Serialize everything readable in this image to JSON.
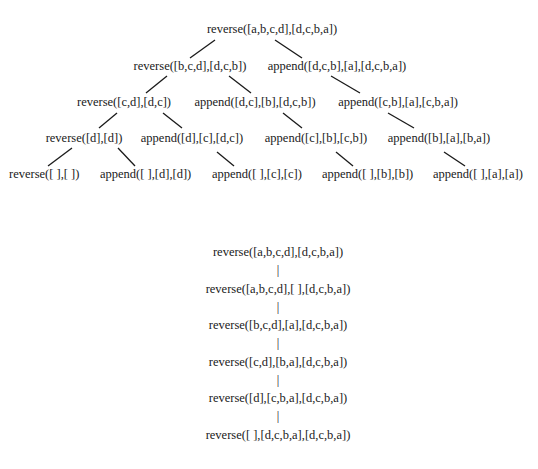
{
  "tree": {
    "nodes": [
      {
        "id": "n0",
        "label": "reverse([a,b,c,d],[d,c,b,a])"
      },
      {
        "id": "n1",
        "label": "reverse([b,c,d],[d,c,b])"
      },
      {
        "id": "n2",
        "label": "append([d,c,b],[a],[d,c,b,a])"
      },
      {
        "id": "n3",
        "label": "reverse([c,d],[d,c])"
      },
      {
        "id": "n4",
        "label": "append([d,c],[b],[d,c,b])"
      },
      {
        "id": "n5",
        "label": "append([c,b],[a],[c,b,a])"
      },
      {
        "id": "n6",
        "label": "reverse([d],[d])"
      },
      {
        "id": "n7",
        "label": "append([d],[c],[d,c])"
      },
      {
        "id": "n8",
        "label": "append([c],[b],[c,b])"
      },
      {
        "id": "n9",
        "label": "append([b],[a],[b,a])"
      },
      {
        "id": "n10",
        "label": "reverse([ ],[ ])"
      },
      {
        "id": "n11",
        "label": "append([ ],[d],[d])"
      },
      {
        "id": "n12",
        "label": "append([ ],[c],[c])"
      },
      {
        "id": "n13",
        "label": "append([ ],[b],[b])"
      },
      {
        "id": "n14",
        "label": "append([ ],[a],[a])"
      }
    ],
    "edges": [
      [
        "n0",
        "n1"
      ],
      [
        "n0",
        "n2"
      ],
      [
        "n1",
        "n3"
      ],
      [
        "n1",
        "n4"
      ],
      [
        "n2",
        "n5"
      ],
      [
        "n3",
        "n6"
      ],
      [
        "n3",
        "n7"
      ],
      [
        "n4",
        "n8"
      ],
      [
        "n5",
        "n9"
      ],
      [
        "n6",
        "n10"
      ],
      [
        "n6",
        "n11"
      ],
      [
        "n7",
        "n12"
      ],
      [
        "n8",
        "n13"
      ],
      [
        "n9",
        "n14"
      ]
    ]
  },
  "chain": {
    "nodes": [
      {
        "label": "reverse([a,b,c,d],[d,c,b,a])"
      },
      {
        "label": "reverse([a,b,c,d],[ ],[d,c,b,a])"
      },
      {
        "label": "reverse([b,c,d],[a],[d,c,b,a])"
      },
      {
        "label": "reverse([c,d],[b,a],[d,c,b,a])"
      },
      {
        "label": "reverse([d],[c,b,a],[d,c,b,a])"
      },
      {
        "label": "reverse([ ],[d,c,b,a],[d,c,b,a])"
      }
    ],
    "connector": "|"
  }
}
